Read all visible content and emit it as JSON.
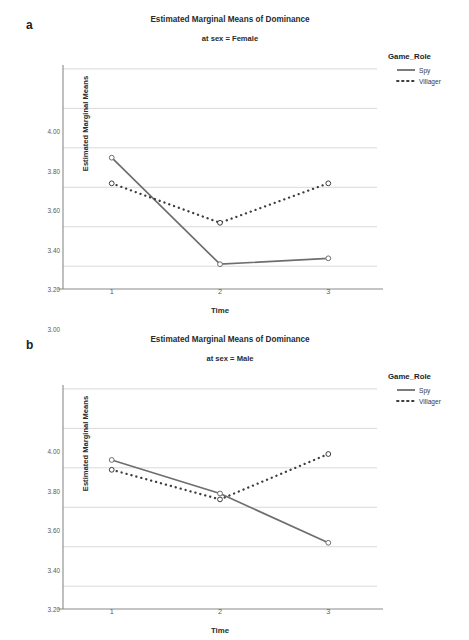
{
  "figure": {
    "panels": [
      {
        "letter": "a",
        "title": "Estimated Marginal Means of Dominance",
        "subtitle": "at sex = Female",
        "chart_data": {
          "type": "line",
          "title": "Estimated Marginal Means of Dominance",
          "subtitle": "at sex = Female",
          "xlabel": "Time",
          "ylabel": "Estimated Marginal Means",
          "categories": [
            "1",
            "2",
            "3"
          ],
          "x": [
            1,
            2,
            3
          ],
          "xlim": [
            0.55,
            3.45
          ],
          "ylim": [
            2.93,
            4.03
          ],
          "yticks": [
            "3.00",
            "3.20",
            "3.40",
            "3.60",
            "3.80",
            "4.00"
          ],
          "ytick_values": [
            3.0,
            3.2,
            3.4,
            3.6,
            3.8,
            4.0
          ],
          "grid": "horizontal",
          "legend_position": "right",
          "legend_title": "Game_Role",
          "series": [
            {
              "name": "Spy",
              "style": "solid",
              "color": "#6e6e6e",
              "values": [
                3.55,
                3.01,
                3.04
              ]
            },
            {
              "name": "Villager",
              "style": "dotted",
              "color": "#3d3d3d",
              "values": [
                3.42,
                3.22,
                3.42
              ]
            }
          ]
        }
      },
      {
        "letter": "b",
        "title": "Estimated Marginal Means of Dominance",
        "subtitle": "at sex = Male",
        "chart_data": {
          "type": "line",
          "title": "Estimated Marginal Means of Dominance",
          "subtitle": "at sex = Male",
          "xlabel": "Time",
          "ylabel": "Estimated Marginal Means",
          "categories": [
            "1",
            "2",
            "3"
          ],
          "x": [
            1,
            2,
            3
          ],
          "xlim": [
            0.55,
            3.45
          ],
          "ylim": [
            2.93,
            4.03
          ],
          "yticks": [
            "3.00",
            "3.20",
            "3.40",
            "3.60",
            "3.80",
            "4.00"
          ],
          "ytick_values": [
            3.0,
            3.2,
            3.4,
            3.6,
            3.8,
            4.0
          ],
          "grid": "horizontal",
          "legend_position": "right",
          "legend_title": "Game_Role",
          "series": [
            {
              "name": "Spy",
              "style": "solid",
              "color": "#6e6e6e",
              "values": [
                3.64,
                3.47,
                3.22
              ]
            },
            {
              "name": "Villager",
              "style": "dotted",
              "color": "#3d3d3d",
              "values": [
                3.59,
                3.44,
                3.67
              ]
            }
          ]
        }
      }
    ],
    "colors": {
      "spy_line": "#6e6e6e",
      "villager_line": "#3d3d3d",
      "gridline": "#d9d9d9",
      "axis": "#8a8a8a",
      "text": "#2b2b2b",
      "background": "#ffffff"
    }
  }
}
